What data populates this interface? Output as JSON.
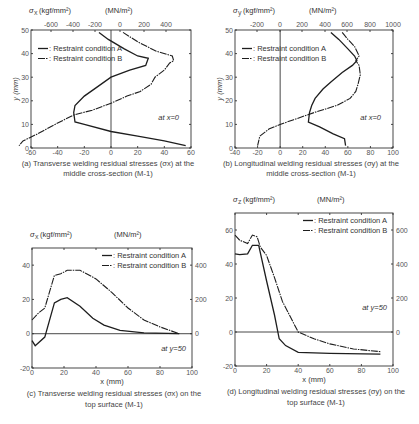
{
  "chart_data": [
    {
      "id": "a",
      "type": "line",
      "title": "(a) Transverse welding residual stresses (σx) at the middle cross-section (M-1)",
      "caption_line1": "(a) Transverse welding residual stresses (σ",
      "caption_sub": "x",
      "caption_line1_end": ") at the",
      "caption_line2": "middle cross-section (M-1)",
      "top_axis_label_left": "σ",
      "top_axis_label_sub": "x",
      "top_axis_label_unit": "(kgf/mm²)",
      "top_axis_label_mn": "(MN/m²)",
      "xlabel": "σx (kgf/mm²)",
      "ylabel": "y (mm)",
      "orientation": "stress on x-axis, y position on y-axis",
      "xlim": [
        -60,
        60
      ],
      "ylim": [
        0,
        50
      ],
      "x_ticks_bottom": [
        "-60",
        "-40",
        "-20",
        "0",
        "20",
        "40",
        "60"
      ],
      "x_ticks_top": [
        "-600",
        "-400",
        "-200",
        "0",
        "200",
        "400"
      ],
      "y_ticks": [
        "0",
        "10",
        "20",
        "30",
        "40",
        "50"
      ],
      "annotation": "at x=0",
      "legend": [
        "—: Restraint condition A",
        "—·: Restraint condition B"
      ],
      "series": [
        {
          "name": "Restraint condition A",
          "points": [
            [
              -9,
              49
            ],
            [
              -2,
              46
            ],
            [
              10,
              42
            ],
            [
              20,
              39
            ],
            [
              28,
              38
            ],
            [
              26,
              35
            ],
            [
              14,
              33
            ],
            [
              0,
              30
            ],
            [
              -10,
              26
            ],
            [
              -20,
              22
            ],
            [
              -27,
              18
            ],
            [
              -28,
              15
            ],
            [
              -27,
              11
            ],
            [
              -20,
              10
            ],
            [
              0,
              7
            ],
            [
              20,
              5
            ],
            [
              40,
              3
            ],
            [
              56,
              1
            ]
          ]
        },
        {
          "name": "Restraint condition B",
          "points": [
            [
              9,
              49
            ],
            [
              20,
              45
            ],
            [
              34,
              41
            ],
            [
              46,
              39
            ],
            [
              47,
              37
            ],
            [
              44,
              36
            ],
            [
              40,
              33
            ],
            [
              33,
              30
            ],
            [
              30,
              27
            ],
            [
              22,
              24
            ],
            [
              12,
              22
            ],
            [
              0,
              19
            ],
            [
              -14,
              16
            ],
            [
              -28,
              14
            ],
            [
              -42,
              10
            ],
            [
              -55,
              6
            ],
            [
              -66,
              3
            ],
            [
              -69,
              1
            ]
          ]
        }
      ]
    },
    {
      "id": "b",
      "type": "line",
      "title": "(b) Longitudinal welding residual stresses (σy) at the middle cross-section (M-1)",
      "caption_line1": "(b) Longitudinal welding residual stresses (σ",
      "caption_sub": "y",
      "caption_line1_end": ") at the",
      "caption_line2": "middle cross-section (M-1)",
      "top_axis_label_left": "σ",
      "top_axis_label_sub": "y",
      "top_axis_label_unit": "(kgf/mm²)",
      "top_axis_label_mn": "(MN/m²)",
      "xlabel": "σy (kgf/mm²)",
      "ylabel": "y (mm)",
      "xlim": [
        -40,
        100
      ],
      "ylim": [
        0,
        50
      ],
      "x_ticks_bottom": [
        "-40",
        "-20",
        "0",
        "20",
        "40",
        "60",
        "80",
        "100"
      ],
      "x_ticks_top": [
        "-200",
        "0",
        "200",
        "400",
        "600",
        "800",
        "1000"
      ],
      "y_ticks": [
        "0",
        "10",
        "20",
        "30",
        "40",
        "50"
      ],
      "annotation": "at x=0",
      "legend": [
        "—: Restraint condition A",
        "—·: Restraint condition B"
      ],
      "series": [
        {
          "name": "Restraint condition A",
          "points": [
            [
              45,
              49
            ],
            [
              52,
              46
            ],
            [
              60,
              42
            ],
            [
              66,
              39
            ],
            [
              68,
              37
            ],
            [
              64,
              35
            ],
            [
              55,
              32
            ],
            [
              45,
              28
            ],
            [
              38,
              25
            ],
            [
              31,
              21
            ],
            [
              28,
              18
            ],
            [
              26,
              15
            ],
            [
              25,
              11
            ],
            [
              35,
              9
            ],
            [
              47,
              6
            ],
            [
              57,
              4
            ],
            [
              58,
              1
            ]
          ]
        },
        {
          "name": "Restraint condition B",
          "points": [
            [
              55,
              49
            ],
            [
              60,
              46
            ],
            [
              66,
              43
            ],
            [
              70,
              39
            ],
            [
              67,
              37
            ],
            [
              70,
              35
            ],
            [
              71,
              31
            ],
            [
              69,
              27
            ],
            [
              67,
              24
            ],
            [
              62,
              21
            ],
            [
              50,
              18
            ],
            [
              30,
              15
            ],
            [
              12,
              12
            ],
            [
              0,
              10
            ],
            [
              -10,
              8
            ],
            [
              -18,
              5
            ],
            [
              -20,
              1
            ]
          ]
        }
      ]
    },
    {
      "id": "c",
      "type": "line",
      "title": "(c) Transverse welding residual stresses (σx) on the top surface (M-1)",
      "caption_line1": "(c) Transverse welding residual stresses (σ",
      "caption_sub": "x",
      "caption_line1_end": ") on the",
      "caption_line2": "top surface (M-1)",
      "top_axis_label_left": "σ",
      "top_axis_label_sub": "x",
      "top_axis_label_unit": "(kgf/mm²)",
      "top_axis_label_mn": "(MN/m²)",
      "xlabel": "x (mm)",
      "ylabel": "σx (kgf/mm²)",
      "xlim": [
        0,
        100
      ],
      "ylim": [
        -20,
        50
      ],
      "x_ticks": [
        "0",
        "20",
        "40",
        "60",
        "80",
        "100"
      ],
      "y_ticks_left": [
        "-20",
        "0",
        "20",
        "40"
      ],
      "y_ticks_right": [
        "0",
        "200",
        "400"
      ],
      "annotation": "at y=50",
      "legend": [
        "—: Restraint condition A",
        "—·: Restraint condition B"
      ],
      "series": [
        {
          "name": "Restraint condition A",
          "points": [
            [
              0,
              -4
            ],
            [
              2,
              -7
            ],
            [
              8,
              -2
            ],
            [
              14,
              18
            ],
            [
              18,
              20
            ],
            [
              22,
              21
            ],
            [
              30,
              16
            ],
            [
              38,
              9
            ],
            [
              45,
              5
            ],
            [
              55,
              2
            ],
            [
              70,
              0.5
            ],
            [
              92,
              0
            ]
          ]
        },
        {
          "name": "Restraint condition B",
          "points": [
            [
              0,
              8
            ],
            [
              4,
              12
            ],
            [
              8,
              15
            ],
            [
              14,
              34
            ],
            [
              18,
              35
            ],
            [
              22,
              37
            ],
            [
              30,
              37
            ],
            [
              40,
              32
            ],
            [
              50,
              24
            ],
            [
              60,
              15
            ],
            [
              70,
              8
            ],
            [
              80,
              4
            ],
            [
              92,
              0
            ]
          ]
        }
      ]
    },
    {
      "id": "d",
      "type": "line",
      "title": "(d) Longitudinal welding residual stresses (σy) on the top surface (M-1)",
      "caption_line1": "(d) Longitudinal welding residual stresses (σ",
      "caption_sub": "y",
      "caption_line1_end": ") on the",
      "caption_line2": "top surface (M-1)",
      "top_axis_label_left": "σ",
      "top_axis_label_sub": "z",
      "top_axis_label_unit": "(kgf/mm²)",
      "top_axis_label_mn": "(MN/m²)",
      "xlabel": "x (mm)",
      "ylabel": "σy (kgf/mm²)",
      "xlim": [
        0,
        100
      ],
      "ylim": [
        -20,
        70
      ],
      "x_ticks": [
        "0",
        "20",
        "40",
        "60",
        "80",
        "100"
      ],
      "y_ticks_left": [
        "-20",
        "0",
        "20",
        "40",
        "60"
      ],
      "y_ticks_right": [
        "0",
        "200",
        "400",
        "600"
      ],
      "annotation": "at y=50",
      "legend": [
        "—: Restraint condition A",
        "—·: Restraint condition B"
      ],
      "series": [
        {
          "name": "Restraint condition A",
          "points": [
            [
              0,
              46
            ],
            [
              3,
              45.5
            ],
            [
              8,
              46
            ],
            [
              11,
              51
            ],
            [
              15,
              51
            ],
            [
              20,
              30
            ],
            [
              25,
              10
            ],
            [
              28,
              -4
            ],
            [
              32,
              -8
            ],
            [
              40,
              -12
            ],
            [
              60,
              -12.5
            ],
            [
              92,
              -13
            ]
          ]
        },
        {
          "name": "Restraint condition B",
          "points": [
            [
              0,
              57
            ],
            [
              3,
              54
            ],
            [
              8,
              52
            ],
            [
              11,
              57
            ],
            [
              14,
              56
            ],
            [
              16,
              50
            ],
            [
              20,
              45
            ],
            [
              25,
              32
            ],
            [
              30,
              18
            ],
            [
              40,
              0
            ],
            [
              50,
              -4
            ],
            [
              60,
              -7
            ],
            [
              75,
              -10
            ],
            [
              92,
              -11.5
            ]
          ]
        }
      ]
    }
  ],
  "figure": {
    "footer_caption": "Figure: Welding residual stress distributions (M-1)"
  }
}
